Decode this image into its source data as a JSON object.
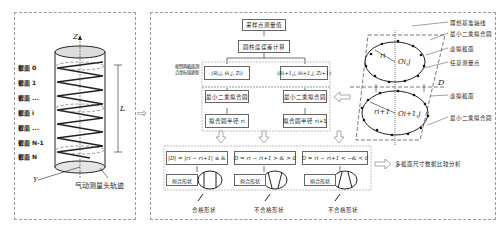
{
  "left_panel": {
    "sections": [
      "截面 0",
      "截面 1",
      "截面 ...",
      "截面 i",
      "截面 ...",
      "截面 N-1",
      "截面 N"
    ],
    "axis_z": "Z",
    "axis_y": "Y",
    "length_label": "L",
    "caption": "气动测量头轨迹"
  },
  "flow": {
    "step1": "采样点测量值",
    "step2": "圆柱度误差计算",
    "side_note": "相邻两截面测点坐标值更新",
    "coord_left": "(Ri,j, θi,j, Zi)",
    "coord_right": "(Ri+1,j, θi+1,j, Zi+1)",
    "fit_left": "最小二乘拟合圆",
    "fit_right": "最小二乘拟合圆",
    "radius_left": "拟合圆半径 ri",
    "radius_right": "拟合圆半径 ri+1"
  },
  "conditions": [
    {
      "formula": "|D| = |ri − ri+1| ≤ &",
      "shape_label": "拟合形状",
      "result": "合格形状"
    },
    {
      "formula": "D = ri − ri+1 > & > 0",
      "shape_label": "拟合形状",
      "result": "不合格形状"
    },
    {
      "formula": "D = ri − ri+1 < −& < 0",
      "shape_label": "拟合形状",
      "result": "不合格形状"
    }
  ],
  "right_diagram": {
    "labels": [
      "理想基准轴线",
      "最小二乘拟合圆",
      "虚拟截面",
      "任意测量点",
      "D",
      "虚拟截面",
      "最小二乘拟合圆"
    ],
    "upper_radius": "ri",
    "upper_center": "Oi,j",
    "lower_radius": "ri+1",
    "lower_center": "Oi+1,j"
  },
  "analysis": "多截面尺寸数据比较分析"
}
